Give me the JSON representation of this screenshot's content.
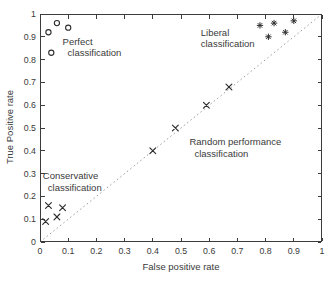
{
  "chart_data": {
    "type": "scatter",
    "title": "",
    "xlabel": "False positive rate",
    "ylabel": "True Positive rate",
    "xlim": [
      0,
      1
    ],
    "ylim": [
      0,
      1
    ],
    "grid": false,
    "legend": "none",
    "ticks": [
      0,
      0.1,
      0.2,
      0.3,
      0.4,
      0.5,
      0.6,
      0.7,
      0.8,
      0.9,
      1
    ],
    "tick_labels": [
      "0",
      "0.1",
      "0.2",
      "0.3",
      "0.4",
      "0.5",
      "0.6",
      "0.7",
      "0.8",
      "0.9",
      "1"
    ],
    "series": [
      {
        "name": "perfect classification",
        "marker": "o",
        "points": [
          [
            0.03,
            0.92
          ],
          [
            0.06,
            0.96
          ],
          [
            0.1,
            0.94
          ],
          [
            0.04,
            0.83
          ]
        ]
      },
      {
        "name": "liberal classification",
        "marker": "*",
        "points": [
          [
            0.78,
            0.95
          ],
          [
            0.83,
            0.96
          ],
          [
            0.9,
            0.97
          ],
          [
            0.87,
            0.92
          ],
          [
            0.81,
            0.9
          ]
        ]
      },
      {
        "name": "random performance classification",
        "marker": "x",
        "points": [
          [
            0.4,
            0.4
          ],
          [
            0.48,
            0.5
          ],
          [
            0.59,
            0.6
          ],
          [
            0.67,
            0.68
          ]
        ]
      },
      {
        "name": "conservative classification",
        "marker": "x",
        "points": [
          [
            0.03,
            0.16
          ],
          [
            0.08,
            0.15
          ],
          [
            0.06,
            0.11
          ],
          [
            0.02,
            0.09
          ]
        ]
      }
    ],
    "reference_line": {
      "style": "dotted",
      "from": [
        0,
        0
      ],
      "to": [
        1,
        1
      ],
      "color": "#9a9a9a"
    },
    "annotations": [
      {
        "name": "perfect-label",
        "lines": [
          "Perfect",
          "classification"
        ],
        "indent2": true,
        "x": 0.08,
        "y": 0.9
      },
      {
        "name": "liberal-label",
        "lines": [
          "Liberal",
          "classification"
        ],
        "indent2": false,
        "x": 0.57,
        "y": 0.94
      },
      {
        "name": "random-label",
        "lines": [
          "Random performance",
          "classification"
        ],
        "indent2": true,
        "x": 0.53,
        "y": 0.46
      },
      {
        "name": "conservative-label",
        "lines": [
          "Conservative",
          "classification"
        ],
        "indent2": true,
        "x": 0.01,
        "y": 0.31
      }
    ],
    "colors": {
      "axis": "#3c3c3c",
      "text": "#3a3a3a",
      "marker": "#2e2e2e",
      "reference_line": "#9a9a9a",
      "background": "#ffffff"
    }
  }
}
